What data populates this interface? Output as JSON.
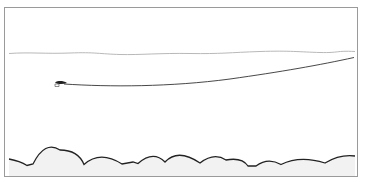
{
  "diagram": {
    "type": "illustration",
    "colors": {
      "frame": "#9a9a9a",
      "surface": "#b0b0b0",
      "line": "#333333",
      "fly": "#222222",
      "bottom": "#222222",
      "bottom_fill": "#f2f2f2"
    },
    "elements": [
      {
        "name": "water-surface",
        "kind": "wavy-line"
      },
      {
        "name": "fishing-line",
        "kind": "curve",
        "from": [
          62,
          84
        ],
        "to": [
          354,
          57
        ]
      },
      {
        "name": "fly",
        "kind": "icon",
        "at": [
          58,
          84
        ]
      },
      {
        "name": "stream-bottom",
        "kind": "scalloped-line"
      }
    ]
  }
}
